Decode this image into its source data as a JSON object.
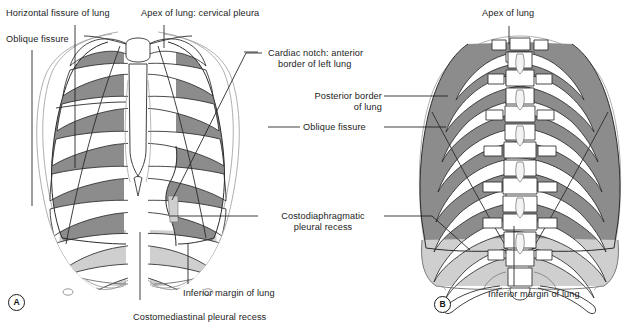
{
  "figure": {
    "type": "anatomical-illustration",
    "panels": [
      {
        "id": "A",
        "view": "anterior"
      },
      {
        "id": "B",
        "view": "posterior"
      }
    ]
  },
  "labels": {
    "horizontal_fissure": "Horizontal fissure of lung",
    "oblique_fissure_left": "Oblique fissure",
    "apex_cervical_pleura": "Apex of lung: cervical pleura",
    "cardiac_notch_l1": "Cardiac notch: anterior",
    "cardiac_notch_l2": "border of left lung",
    "posterior_border_l1": "Posterior border",
    "posterior_border_l2": "of lung",
    "oblique_fissure_mid": "Oblique fissure",
    "costodiaphragmatic_l1": "Costodiaphragmatic",
    "costodiaphragmatic_l2": "pleural recess",
    "inferior_margin_a": "Inferior margin of lung",
    "costomediastinal": "Costomediastinal pleural recess",
    "apex_of_lung_b": "Apex of lung",
    "inferior_margin_b": "Inferior margin of lung",
    "panel_a": "A",
    "panel_b": "B"
  },
  "colors": {
    "lung_dark": "#8c8c8c",
    "pleura_light": "#cfcfcf",
    "bone_fill": "#ffffff",
    "outline": "#2b2b2b",
    "faint_outline": "#8e8e8e",
    "leader": "#1d1d1d",
    "text": "#1d1d1d",
    "background": "#ffffff"
  },
  "legend_keys": [
    {
      "swatch": "#8c8c8c",
      "meaning": "lung projected over rib"
    },
    {
      "swatch": "#cfcfcf",
      "meaning": "pleural recess below lung margin"
    }
  ]
}
